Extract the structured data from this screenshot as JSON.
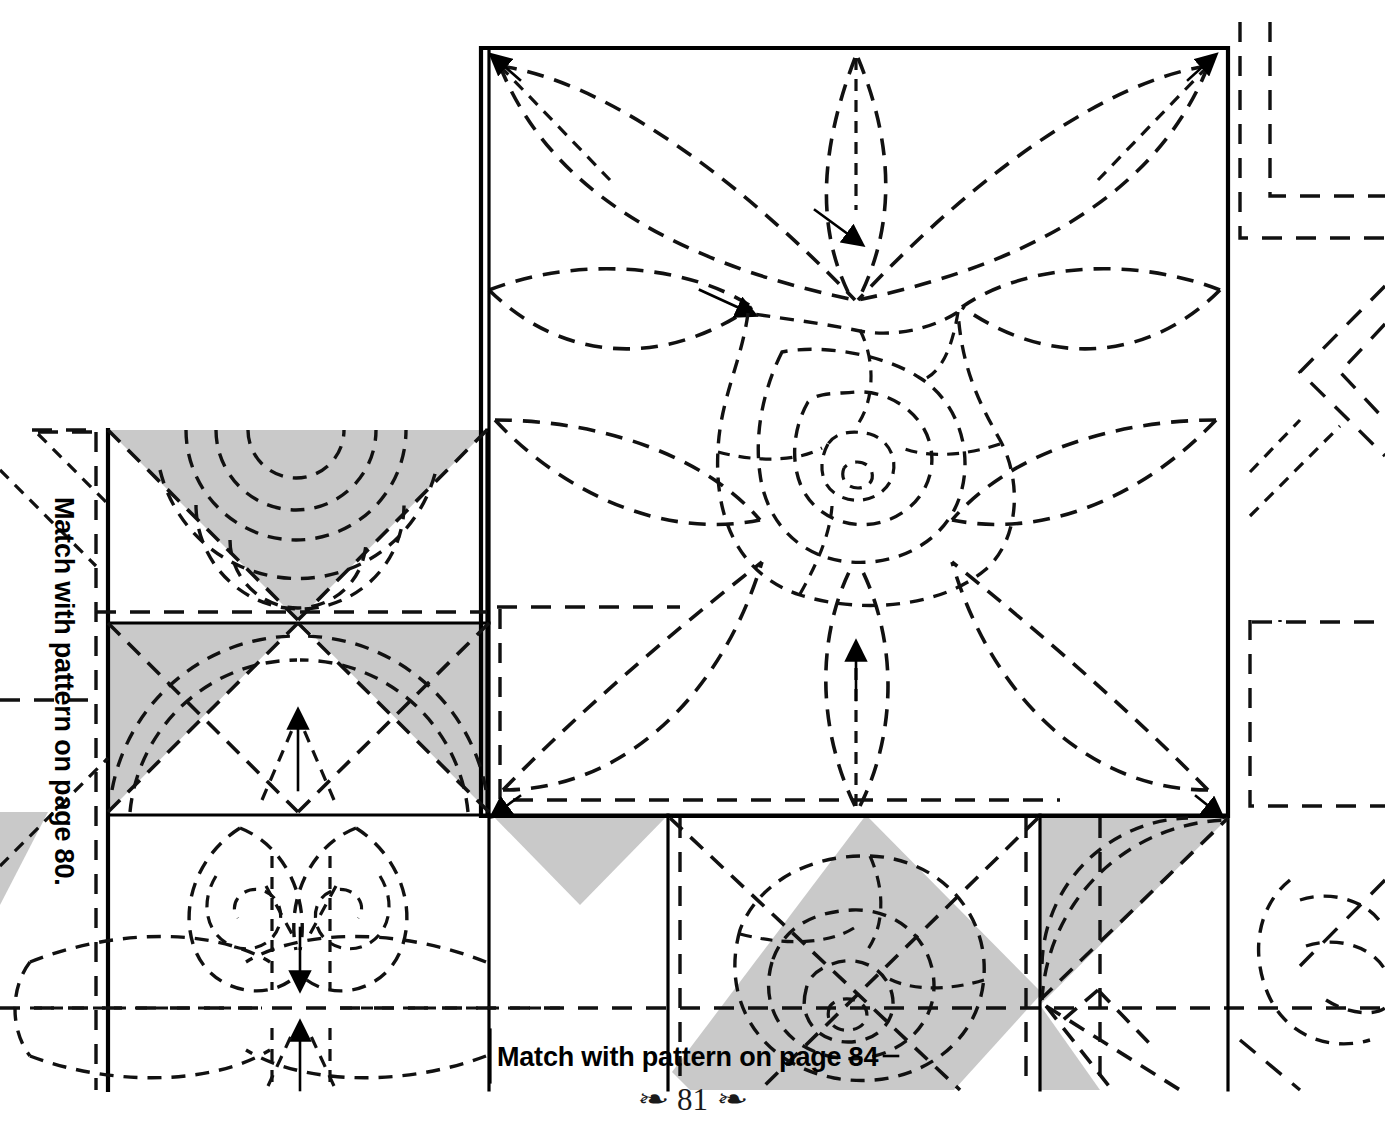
{
  "page": {
    "folio_number": "81",
    "swash_left": "❧",
    "swash_right": "❧",
    "background_color": "#ffffff",
    "ink_color": "#000000",
    "shade_color": "#c9c9c9"
  },
  "labels": {
    "match_left": "Match with pattern on page 80.",
    "match_bottom": "Match with pattern on page 84"
  },
  "diagram": {
    "blocks": [
      {
        "name": "rose-leaf-block",
        "motif": "eight-petal leaf wreath with centre rose spiral",
        "shaded": false
      },
      {
        "name": "hourglass-block-upper",
        "motif": "clamshell arcs in shaded triangle",
        "shaded": true
      },
      {
        "name": "hourglass-block-lower",
        "motif": "clamshell arcs in shaded triangles",
        "shaded": true
      },
      {
        "name": "feather-scroll-block",
        "motif": "double scroll feather with starburst centre",
        "shaded": false
      },
      {
        "name": "rose-diamond-block",
        "motif": "rose spiral on shaded on-point square",
        "shaded": true
      },
      {
        "name": "corner-fan-block",
        "motif": "quarter fan arcs in shaded triangle",
        "shaded": true
      }
    ],
    "registration_marks": [
      "top-right-corner-dashes",
      "right-edge-corner-dashes",
      "right-chevron-dashes",
      "bottom-right-dashes"
    ]
  }
}
